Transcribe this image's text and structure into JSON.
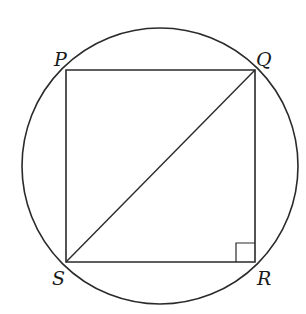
{
  "diagram": {
    "colors": {
      "stroke": "#2a2a2a",
      "background": "#ffffff",
      "label": "#1a1a1a"
    },
    "circle": {
      "cx": 160,
      "cy": 166,
      "r": 138
    },
    "vertices": [
      {
        "name": "P",
        "x": 66,
        "y": 70,
        "label": "P",
        "lx": 54,
        "ly": 66
      },
      {
        "name": "Q",
        "x": 255,
        "y": 70,
        "label": "Q",
        "lx": 256,
        "ly": 66
      },
      {
        "name": "R",
        "x": 255,
        "y": 262,
        "label": "R",
        "lx": 257,
        "ly": 285
      },
      {
        "name": "S",
        "x": 66,
        "y": 262,
        "label": "S",
        "lx": 52,
        "ly": 285
      }
    ],
    "diagonal": {
      "from": "S",
      "to": "Q"
    },
    "right_angle_marker": {
      "at": "R",
      "size": 19
    }
  }
}
